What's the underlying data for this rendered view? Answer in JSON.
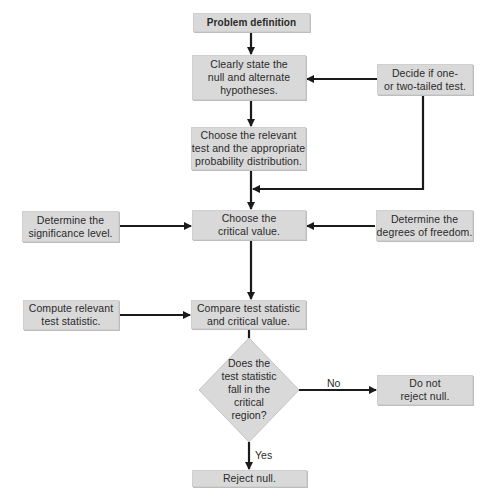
{
  "colors": {
    "box_fill": "#d9d9d9",
    "line": "#1a1a1a",
    "text": "#2a2a2a",
    "background": "#ffffff"
  },
  "nodes": {
    "problem_definition": "Problem definition",
    "state_hypotheses": "Clearly state the\nnull and alternate\nhypotheses.",
    "decide_tails": "Decide if one-\nor two-tailed test.",
    "choose_test": "Choose the relevant\ntest and the appropriate\nprobability distribution.",
    "significance_level": "Determine the\nsignificance level.",
    "critical_value": "Choose the\ncritical value.",
    "degrees_freedom": "Determine the\ndegrees of freedom.",
    "compute_statistic": "Compute relevant\ntest statistic.",
    "compare": "Compare test statistic\nand critical value.",
    "decision": "Does the\ntest statistic\nfall in the\ncritical\nregion?",
    "do_not_reject": "Do not\nreject null.",
    "reject": "Reject null."
  },
  "edge_labels": {
    "no": "No",
    "yes": "Yes"
  }
}
